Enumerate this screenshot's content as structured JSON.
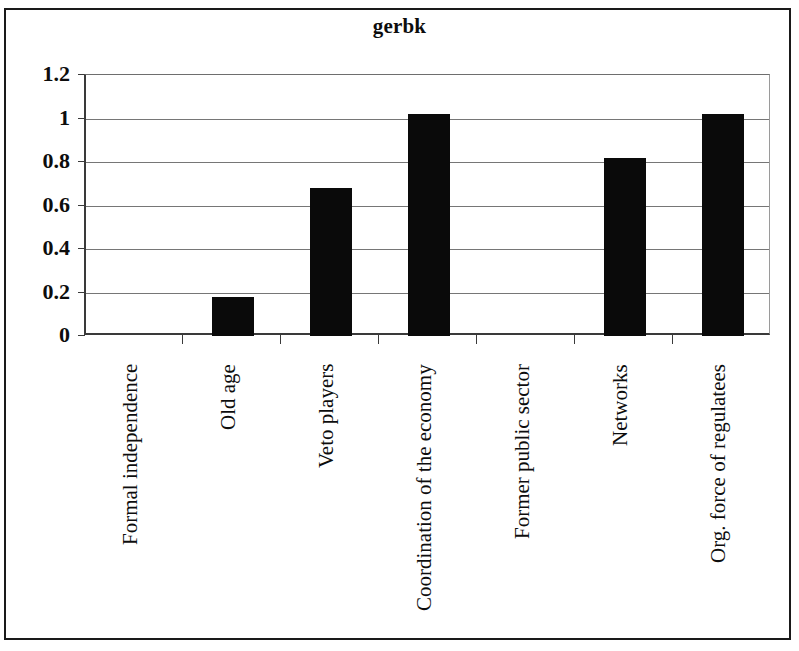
{
  "chart_data": {
    "type": "bar",
    "title": "gerbk",
    "xlabel": "",
    "ylabel": "",
    "categories": [
      "Formal independence",
      "Old age",
      "Veto players",
      "Coordination of the economy",
      "Former public sector",
      "Networks",
      "Org. force of regulatees"
    ],
    "values": [
      0,
      0.18,
      0.68,
      1.02,
      0,
      0.82,
      1.02
    ],
    "ylim": [
      0,
      1.2
    ],
    "ytick_labels": [
      "0",
      "0.2",
      "0.4",
      "0.6",
      "0.8",
      "1",
      "1.2"
    ],
    "ytick_values": [
      0,
      0.2,
      0.4,
      0.6,
      0.8,
      1,
      1.2
    ],
    "grid": true,
    "legend": false,
    "bar_color": "#0a0a0a",
    "axis_color": "#3a3a3a",
    "gridline_color": "#767676",
    "background_color": "#ffffff",
    "category_label_rotation": -90
  }
}
